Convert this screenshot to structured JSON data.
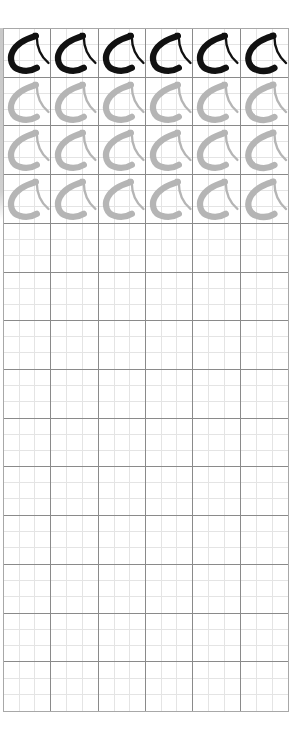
{
  "worksheet": {
    "columns": 6,
    "rows": 14,
    "glyph_label": "calligraphy-character",
    "colors": {
      "solid_glyph": "#111111",
      "trace_glyph": "#b5b5b5",
      "major_line": "#8a8a8a",
      "minor_line": "#e4e4e4",
      "border": "#a8a8a8"
    },
    "row_modes": [
      "solid",
      "trace",
      "trace",
      "trace",
      "empty",
      "empty",
      "empty",
      "empty",
      "empty",
      "empty",
      "empty",
      "empty",
      "empty",
      "empty"
    ]
  }
}
